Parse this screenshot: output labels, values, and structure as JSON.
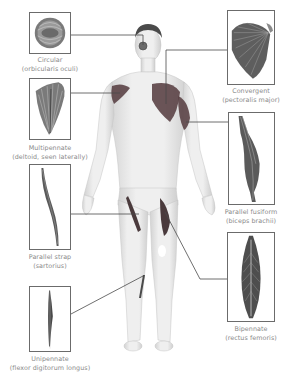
{
  "colors": {
    "box_border": "#6b6b6b",
    "label_text": "#8a8a8a",
    "leader_line": "#4a4a4a",
    "muscle_dark": "#3a3a3a",
    "muscle_red_tint": "#5a3a3e",
    "skin": "#e8e8e8"
  },
  "muscles": [
    {
      "id": "circular",
      "type": "Circular",
      "example": "(orbicularis oculi)",
      "side": "left",
      "body_location": "eye"
    },
    {
      "id": "multipennate",
      "type": "Multipennate",
      "example": "(deltoid, seen laterally)",
      "side": "left",
      "body_location": "right shoulder"
    },
    {
      "id": "parallel-strap",
      "type": "Parallel strap",
      "example": "(sartorius)",
      "side": "left",
      "body_location": "thigh"
    },
    {
      "id": "unipennate",
      "type": "Unipennate",
      "example": "(flexor digitorum longus)",
      "side": "left",
      "body_location": "lower leg"
    },
    {
      "id": "convergent",
      "type": "Convergent",
      "example": "(pectoralis major)",
      "side": "right",
      "body_location": "chest"
    },
    {
      "id": "parallel-fusiform",
      "type": "Parallel fusiform",
      "example": "(biceps brachii)",
      "side": "right",
      "body_location": "upper arm"
    },
    {
      "id": "bipennate",
      "type": "Bipennate",
      "example": "(rectus femoris)",
      "side": "right",
      "body_location": "thigh"
    }
  ]
}
